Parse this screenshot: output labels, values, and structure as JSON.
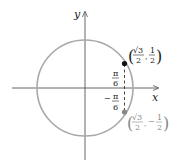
{
  "diagram": {
    "x_axis_label": "x",
    "y_axis_label": "y",
    "angle_top": {
      "num": "π",
      "den": "6",
      "sign": ""
    },
    "angle_bottom": {
      "num": "π",
      "den": "6",
      "sign": "−"
    },
    "point_top": {
      "x_num": "√3",
      "x_den": "2",
      "y_num": "1",
      "y_den": "2",
      "y_sign": ""
    },
    "point_bottom": {
      "x_num": "√3",
      "x_den": "2",
      "y_num": "1",
      "y_den": "2",
      "y_sign": "−"
    },
    "colors": {
      "circle": "#a8a8a8",
      "axes": "#555555",
      "point_top": "#111111",
      "point_bottom": "#888888"
    }
  }
}
